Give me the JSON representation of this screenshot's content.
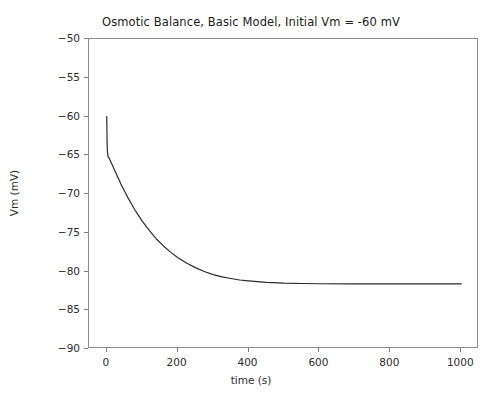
{
  "chart_data": {
    "type": "line",
    "title": "Osmotic Balance, Basic Model, Initial Vm = -60 mV",
    "xlabel": "time (s)",
    "ylabel": "Vm (mV)",
    "xlim": [
      -50,
      1050
    ],
    "ylim": [
      -90,
      -50
    ],
    "xticks": [
      0,
      200,
      400,
      600,
      800,
      1000
    ],
    "xtick_labels": [
      "0",
      "200",
      "400",
      "600",
      "800",
      "1000"
    ],
    "yticks": [
      -50,
      -55,
      -60,
      -65,
      -70,
      -75,
      -80,
      -85,
      -90
    ],
    "ytick_labels": [
      "−50",
      "−55",
      "−60",
      "−65",
      "−70",
      "−75",
      "−80",
      "−85",
      "−90"
    ],
    "grid": false,
    "legend": null,
    "line_color": "#2b2b2b",
    "line_width": 1.2,
    "series": [
      {
        "name": "Vm",
        "x": [
          0,
          1,
          2,
          4,
          6,
          8,
          10,
          13,
          16,
          20,
          25,
          30,
          35,
          40,
          50,
          60,
          70,
          80,
          90,
          100,
          120,
          140,
          160,
          180,
          200,
          225,
          250,
          275,
          300,
          325,
          350,
          375,
          400,
          450,
          500,
          550,
          600,
          700,
          800,
          900,
          1000
        ],
        "y": [
          -60.0,
          -63.2,
          -64.6,
          -65.2,
          -65.3,
          -65.5,
          -65.7,
          -66.0,
          -66.3,
          -66.7,
          -67.2,
          -67.7,
          -68.2,
          -68.7,
          -69.6,
          -70.5,
          -71.3,
          -72.1,
          -72.8,
          -73.5,
          -74.7,
          -75.8,
          -76.7,
          -77.5,
          -78.2,
          -78.9,
          -79.5,
          -80.0,
          -80.4,
          -80.7,
          -80.9,
          -81.1,
          -81.2,
          -81.4,
          -81.5,
          -81.55,
          -81.58,
          -81.6,
          -81.6,
          -81.6,
          -81.6
        ]
      }
    ],
    "initial_vm": -60,
    "steady_state_vm": -81.6,
    "fast_drop_vm": -65.2
  }
}
